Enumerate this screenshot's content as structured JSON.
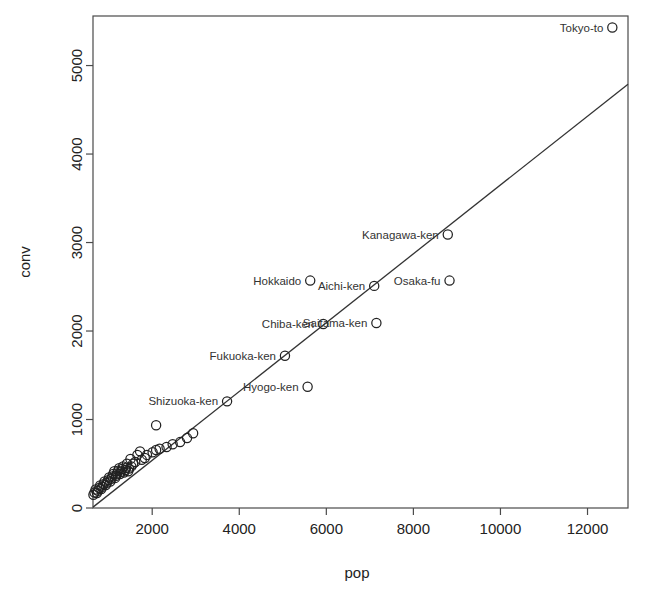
{
  "chart_data": {
    "type": "scatter",
    "title": "",
    "xlabel": "pop",
    "ylabel": "conv",
    "xlim": [
      640,
      12930
    ],
    "ylim": [
      0,
      5560
    ],
    "grid": false,
    "legend": null,
    "xticks": [
      2000,
      4000,
      6000,
      8000,
      10000,
      12000
    ],
    "xtick_labels": [
      "2000",
      "4000",
      "6000",
      "8000",
      "10000",
      "12000"
    ],
    "yticks": [
      0,
      1000,
      2000,
      3000,
      4000,
      5000
    ],
    "ytick_labels": [
      "0",
      "1000",
      "2000",
      "3000",
      "4000",
      "5000"
    ],
    "marker": "open-circle",
    "trendline": {
      "type": "linear-fit",
      "x_start": 640,
      "y_start": 10,
      "x_end": 12930,
      "y_end": 4790
    },
    "points": [
      {
        "label": "Tokyo-to",
        "x": 12570,
        "y": 5430,
        "label_side": "left"
      },
      {
        "label": "Kanagawa-ken",
        "x": 8790,
        "y": 3090,
        "label_side": "left"
      },
      {
        "label": "Osaka-fu",
        "x": 8830,
        "y": 2570,
        "label_side": "left"
      },
      {
        "label": "Aichi-ken",
        "x": 7100,
        "y": 2510,
        "label_side": "left"
      },
      {
        "label": "Hokkaido",
        "x": 5630,
        "y": 2570,
        "label_side": "left"
      },
      {
        "label": "Saitama-ken",
        "x": 7150,
        "y": 2090,
        "label_side": "left"
      },
      {
        "label": "Chiba-ken",
        "x": 5930,
        "y": 2080,
        "label_side": "left"
      },
      {
        "label": "Hyogo-ken",
        "x": 5570,
        "y": 1370,
        "label_side": "left"
      },
      {
        "label": "Fukuoka-ken",
        "x": 5050,
        "y": 1720,
        "label_side": "left"
      },
      {
        "label": "Shizuoka-ken",
        "x": 3720,
        "y": 1205,
        "label_side": "left"
      },
      {
        "label": "",
        "x": 2940,
        "y": 845
      },
      {
        "label": "",
        "x": 2800,
        "y": 790
      },
      {
        "label": "",
        "x": 2640,
        "y": 745
      },
      {
        "label": "",
        "x": 2470,
        "y": 720
      },
      {
        "label": "",
        "x": 2330,
        "y": 690
      },
      {
        "label": "",
        "x": 2170,
        "y": 670
      },
      {
        "label": "",
        "x": 2090,
        "y": 655
      },
      {
        "label": "",
        "x": 2010,
        "y": 630
      },
      {
        "label": "",
        "x": 2090,
        "y": 935
      },
      {
        "label": "",
        "x": 1880,
        "y": 600
      },
      {
        "label": "",
        "x": 1830,
        "y": 565
      },
      {
        "label": "",
        "x": 1760,
        "y": 545
      },
      {
        "label": "",
        "x": 1720,
        "y": 640
      },
      {
        "label": "",
        "x": 1660,
        "y": 600
      },
      {
        "label": "",
        "x": 1610,
        "y": 520
      },
      {
        "label": "",
        "x": 1560,
        "y": 500
      },
      {
        "label": "",
        "x": 1520,
        "y": 470
      },
      {
        "label": "",
        "x": 1500,
        "y": 555
      },
      {
        "label": "",
        "x": 1470,
        "y": 445
      },
      {
        "label": "",
        "x": 1450,
        "y": 415
      },
      {
        "label": "",
        "x": 1420,
        "y": 500
      },
      {
        "label": "",
        "x": 1400,
        "y": 455
      },
      {
        "label": "",
        "x": 1380,
        "y": 430
      },
      {
        "label": "",
        "x": 1350,
        "y": 400
      },
      {
        "label": "",
        "x": 1330,
        "y": 470
      },
      {
        "label": "",
        "x": 1310,
        "y": 440
      },
      {
        "label": "",
        "x": 1280,
        "y": 410
      },
      {
        "label": "",
        "x": 1260,
        "y": 385
      },
      {
        "label": "",
        "x": 1240,
        "y": 450
      },
      {
        "label": "",
        "x": 1215,
        "y": 420
      },
      {
        "label": "",
        "x": 1190,
        "y": 390
      },
      {
        "label": "",
        "x": 1170,
        "y": 365
      },
      {
        "label": "",
        "x": 1150,
        "y": 340
      },
      {
        "label": "",
        "x": 1130,
        "y": 415
      },
      {
        "label": "",
        "x": 1105,
        "y": 385
      },
      {
        "label": "",
        "x": 1080,
        "y": 355
      },
      {
        "label": "",
        "x": 1060,
        "y": 330
      },
      {
        "label": "",
        "x": 1035,
        "y": 300
      },
      {
        "label": "",
        "x": 1010,
        "y": 345
      },
      {
        "label": "",
        "x": 985,
        "y": 315
      },
      {
        "label": "",
        "x": 960,
        "y": 285
      },
      {
        "label": "",
        "x": 935,
        "y": 260
      },
      {
        "label": "",
        "x": 905,
        "y": 300
      },
      {
        "label": "",
        "x": 880,
        "y": 270
      },
      {
        "label": "",
        "x": 855,
        "y": 240
      },
      {
        "label": "",
        "x": 830,
        "y": 215
      },
      {
        "label": "",
        "x": 805,
        "y": 255
      },
      {
        "label": "",
        "x": 780,
        "y": 225
      },
      {
        "label": "",
        "x": 755,
        "y": 195
      },
      {
        "label": "",
        "x": 730,
        "y": 170
      },
      {
        "label": "",
        "x": 700,
        "y": 210
      },
      {
        "label": "",
        "x": 675,
        "y": 175
      },
      {
        "label": "",
        "x": 650,
        "y": 150
      }
    ]
  }
}
